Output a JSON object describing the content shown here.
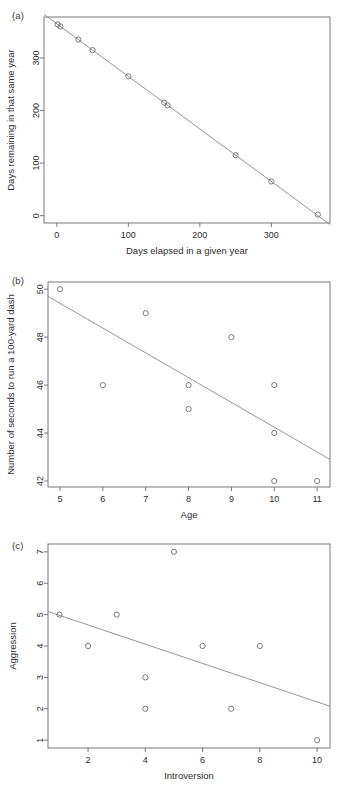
{
  "figure": {
    "background": "#ffffff",
    "line_color": "#8a8a8a",
    "point_color": "#6e6e6e",
    "axis_color": "#6a6a6a",
    "text_color": "#2e2e2e"
  },
  "panels": [
    {
      "tag": "(a)"
    },
    {
      "tag": "(b)"
    },
    {
      "tag": "(c)"
    }
  ],
  "chart_data": [
    {
      "type": "scatter",
      "panel": "(a)",
      "title": "",
      "xlabel": "Days elapsed in a given year",
      "ylabel": "Days remaining in that same year",
      "xlim": [
        -18,
        382
      ],
      "ylim": [
        -14,
        378
      ],
      "xticks": [
        0,
        100,
        200,
        300
      ],
      "yticks": [
        0,
        100,
        200,
        300
      ],
      "xticklabels": [
        "0",
        "100",
        "200",
        "300"
      ],
      "yticklabels": [
        "0",
        "100",
        "200",
        "300"
      ],
      "grid": false,
      "legend": "none",
      "x": [
        1,
        5,
        30,
        50,
        100,
        150,
        155,
        250,
        300,
        365
      ],
      "y": [
        364,
        360,
        335,
        315,
        265,
        215,
        210,
        115,
        65,
        2
      ],
      "trendline": {
        "x": [
          -18,
          382
        ],
        "y": [
          383,
          -17
        ]
      }
    },
    {
      "type": "scatter",
      "panel": "(b)",
      "title": "",
      "xlabel": "Age",
      "ylabel": "Number of seconds to run a 100-yard dash",
      "xlim": [
        4.72,
        11.3
      ],
      "ylim": [
        41.75,
        50.3
      ],
      "xticks": [
        5,
        6,
        7,
        8,
        9,
        10,
        11
      ],
      "yticks": [
        42,
        44,
        46,
        48,
        50
      ],
      "xticklabels": [
        "5",
        "6",
        "7",
        "8",
        "9",
        "10",
        "11"
      ],
      "yticklabels": [
        "42",
        "44",
        "46",
        "48",
        "50"
      ],
      "grid": false,
      "legend": "none",
      "x": [
        5,
        6,
        7,
        8,
        8,
        9,
        10,
        10,
        10,
        11
      ],
      "y": [
        50,
        46,
        49,
        46,
        45,
        48,
        46,
        44,
        42,
        42
      ],
      "trendline": {
        "x": [
          4.72,
          11.3
        ],
        "y": [
          49.7,
          42.9
        ]
      }
    },
    {
      "type": "scatter",
      "panel": "(c)",
      "title": "",
      "xlabel": "Introversion",
      "ylabel": "Aggression",
      "xlim": [
        0.6,
        10.45
      ],
      "ylim": [
        0.75,
        7.25
      ],
      "xticks": [
        2,
        4,
        6,
        8,
        10
      ],
      "yticks": [
        1,
        2,
        3,
        4,
        5,
        6,
        7
      ],
      "xticklabels": [
        "2",
        "4",
        "6",
        "8",
        "10"
      ],
      "yticklabels": [
        "1",
        "2",
        "3",
        "4",
        "5",
        "6",
        "7"
      ],
      "grid": false,
      "legend": "none",
      "x": [
        1,
        2,
        3,
        4,
        4,
        5,
        6,
        7,
        8,
        10
      ],
      "y": [
        5,
        4,
        5,
        3,
        2,
        7,
        4,
        2,
        4,
        1
      ],
      "trendline": {
        "x": [
          0.6,
          10.45
        ],
        "y": [
          5.1,
          2.08
        ]
      }
    }
  ]
}
